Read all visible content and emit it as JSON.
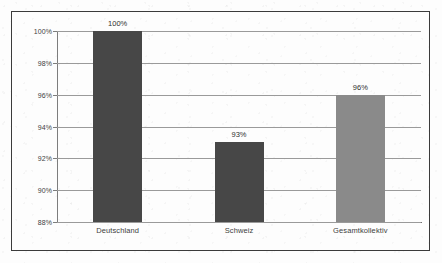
{
  "chart_data": {
    "type": "bar",
    "title": "",
    "subtitle": "",
    "xlabel": "",
    "ylabel": "",
    "categories": [
      "Deutschland",
      "Schweiz",
      "Gesamtkollektiv"
    ],
    "values": [
      100,
      93,
      96
    ],
    "value_labels": [
      "100%",
      "93%",
      "96%"
    ],
    "ylim": [
      88,
      100
    ],
    "ytick_values": [
      88,
      90,
      92,
      94,
      96,
      98,
      100
    ],
    "ytick_labels": [
      "88%",
      "90%",
      "92%",
      "94%",
      "96%",
      "98%",
      "100%"
    ],
    "grid": true,
    "legend": "none",
    "bar_colors": [
      "#474747",
      "#474747",
      "#8a8a8a"
    ],
    "series": [
      {
        "name": "",
        "values": [
          100,
          93,
          96
        ]
      }
    ]
  },
  "style": {
    "gridline_color": "#9a9a9a",
    "axis_color": "#7d7d7d",
    "frame_color": "#3b3b3b",
    "background_color": "#fdfdfd",
    "label_color": "#3d3d3d"
  }
}
